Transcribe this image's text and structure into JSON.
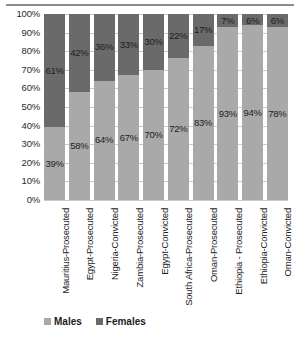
{
  "chart_data": {
    "type": "bar",
    "subtype": "stacked-100-percent",
    "title": "",
    "xlabel": "",
    "ylabel": "",
    "ylim": [
      0,
      100
    ],
    "ytick_labels": [
      "100%",
      "90%",
      "80%",
      "70%",
      "60%",
      "50%",
      "40%",
      "30%",
      "20%",
      "10%",
      "0%"
    ],
    "grid": true,
    "legend_position": "bottom-left",
    "categories": [
      "Mauritius-Prosecuted",
      "Egypt-Prosecuted",
      "Nigeria-Convicted",
      "Zambia-Prosecuted",
      "Egypt-Convicted",
      "South Africa-Prosecuted",
      "Oman-Prosecuted",
      "Ethiopia - Prosecuted",
      "Ethiopia-Convicted",
      "Oman-Convicted"
    ],
    "series": [
      {
        "name": "Males",
        "color": "#a9a9a9",
        "values": [
          39,
          58,
          64,
          67,
          70,
          72,
          83,
          93,
          94,
          78
        ],
        "labels": [
          "39%",
          "58%",
          "64%",
          "67%",
          "70%",
          "72%",
          "83%",
          "93%",
          "94%",
          "78%"
        ]
      },
      {
        "name": "Females",
        "color": "#6a6a6a",
        "values": [
          61,
          42,
          36,
          33,
          30,
          22,
          17,
          7,
          6,
          6
        ],
        "labels": [
          "61%",
          "42%",
          "36%",
          "33%",
          "30%",
          "22%",
          "17%",
          "7%",
          "6%",
          "6%"
        ]
      }
    ]
  },
  "legend": {
    "males_label": "Males",
    "females_label": "Females"
  }
}
